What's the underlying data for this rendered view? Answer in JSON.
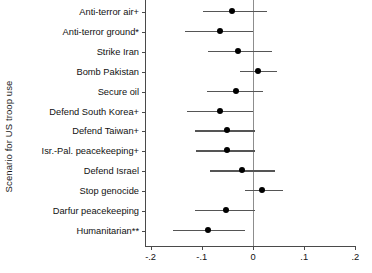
{
  "chart_data": {
    "type": "scatter",
    "title": "",
    "subtitle": "",
    "xlabel": "",
    "ylabel": "Scenario for US troop use",
    "xlim": [
      -0.21,
      0.22
    ],
    "grid": false,
    "legend": "none",
    "orientation": "horizontal",
    "marker": "filled-circle",
    "error_bars": "horizontal confidence intervals",
    "zero_reference_line": 0,
    "xticks": [
      -0.2,
      -0.1,
      0,
      0.1,
      0.2
    ],
    "xtick_labels": [
      "-.2",
      "-.1",
      "0",
      ".1",
      ".2"
    ],
    "categories": [
      "Anti-terror air+",
      "Anti-terror ground*",
      "Strike Iran",
      "Bomb Pakistan",
      "Secure oil",
      "Defend South Korea+",
      "Defend Taiwan+",
      "Isr.-Pal. peacekeeping+",
      "Defend Israel",
      "Stop genocide",
      "Darfur peacekeeping",
      "Humanitarian**"
    ],
    "values": [
      -0.041,
      -0.064,
      -0.029,
      0.01,
      -0.033,
      -0.064,
      -0.051,
      -0.051,
      -0.021,
      0.018,
      -0.053,
      -0.088
    ],
    "ci_low": [
      -0.098,
      -0.133,
      -0.088,
      -0.025,
      -0.09,
      -0.129,
      -0.113,
      -0.111,
      -0.084,
      -0.016,
      -0.113,
      -0.156
    ],
    "ci_high": [
      0.027,
      0.0,
      0.037,
      0.047,
      0.02,
      0.0,
      0.004,
      0.004,
      0.043,
      0.059,
      0.004,
      -0.016
    ],
    "points": [
      {
        "category": "Anti-terror air+",
        "value": -0.041,
        "ci_low": -0.098,
        "ci_high": 0.027
      },
      {
        "category": "Anti-terror ground*",
        "value": -0.064,
        "ci_low": -0.133,
        "ci_high": 0.0
      },
      {
        "category": "Strike Iran",
        "value": -0.029,
        "ci_low": -0.088,
        "ci_high": 0.037
      },
      {
        "category": "Bomb Pakistan",
        "value": 0.01,
        "ci_low": -0.025,
        "ci_high": 0.047
      },
      {
        "category": "Secure oil",
        "value": -0.033,
        "ci_low": -0.09,
        "ci_high": 0.02
      },
      {
        "category": "Defend South Korea+",
        "value": -0.064,
        "ci_low": -0.129,
        "ci_high": 0.0
      },
      {
        "category": "Defend Taiwan+",
        "value": -0.051,
        "ci_low": -0.113,
        "ci_high": 0.004
      },
      {
        "category": "Isr.-Pal. peacekeeping+",
        "value": -0.051,
        "ci_low": -0.111,
        "ci_high": 0.004
      },
      {
        "category": "Defend Israel",
        "value": -0.021,
        "ci_low": -0.084,
        "ci_high": 0.043
      },
      {
        "category": "Stop genocide",
        "value": 0.018,
        "ci_low": -0.016,
        "ci_high": 0.059
      },
      {
        "category": "Darfur peacekeeping",
        "value": -0.053,
        "ci_low": -0.113,
        "ci_high": 0.004
      },
      {
        "category": "Humanitarian**",
        "value": -0.088,
        "ci_low": -0.156,
        "ci_high": -0.016
      }
    ],
    "colors": {
      "marker": "#000000",
      "error_bar": "#555555",
      "axis": "#4a4a4a",
      "zero_line": "#8d8d8d",
      "background": "#ffffff"
    }
  }
}
